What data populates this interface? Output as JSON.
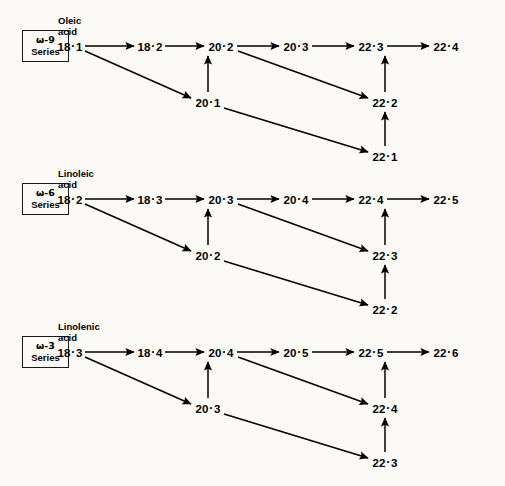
{
  "figure": {
    "separator": "·",
    "ink_color": "#000000",
    "background_color": "#fbfaf7"
  },
  "series": [
    {
      "id": "omega-9",
      "box_label_line1": "ω-9",
      "box_label_line2": "Series",
      "precursor_name_line1": "Oleic",
      "precursor_name_line2": "acid",
      "top_row": [
        "18·1",
        "18·2",
        "20·2",
        "20·3",
        "22·3",
        "22·4"
      ],
      "middle_row": [
        "20·1",
        "22·2"
      ],
      "bottom_row": [
        "22·1"
      ]
    },
    {
      "id": "omega-6",
      "box_label_line1": "ω-6",
      "box_label_line2": "Series",
      "precursor_name_line1": "Linoleic",
      "precursor_name_line2": "acid",
      "top_row": [
        "18·2",
        "18·3",
        "20·3",
        "20·4",
        "22·4",
        "22·5"
      ],
      "middle_row": [
        "20·2",
        "22·3"
      ],
      "bottom_row": [
        "22·2"
      ]
    },
    {
      "id": "omega-3",
      "box_label_line1": "ω-3",
      "box_label_line2": "Series",
      "precursor_name_line1": "Linolenic",
      "precursor_name_line2": "acid",
      "top_row": [
        "18·3",
        "18·4",
        "20·4",
        "20·5",
        "22·5",
        "22·6"
      ],
      "middle_row": [
        "20·3",
        "22·4"
      ],
      "bottom_row": [
        "22·3"
      ]
    }
  ]
}
